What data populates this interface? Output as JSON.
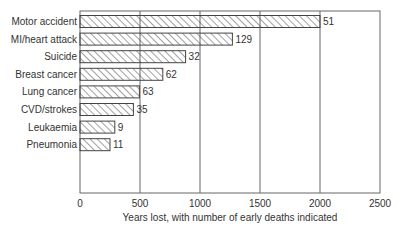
{
  "chart_data": {
    "type": "bar",
    "orientation": "horizontal",
    "title": "",
    "xlabel": "Years lost, with number of early deaths indicated",
    "ylabel": "",
    "xlim": [
      0,
      2500
    ],
    "xticks": [
      0,
      500,
      1000,
      1500,
      2000,
      2500
    ],
    "grid": "vertical",
    "categories": [
      "Motor accident",
      "MI/heart attack",
      "Suicide",
      "Breast cancer",
      "Lung cancer",
      "CVD/strokes",
      "Leukaemia",
      "Pneumonia"
    ],
    "values": [
      2000,
      1270,
      880,
      690,
      495,
      445,
      290,
      250
    ],
    "annotations": [
      51,
      129,
      32,
      62,
      63,
      35,
      9,
      11
    ],
    "bar_fill": "hatched"
  },
  "colors": {
    "line": "#555555",
    "text": "#333333",
    "background": "#ffffff"
  }
}
